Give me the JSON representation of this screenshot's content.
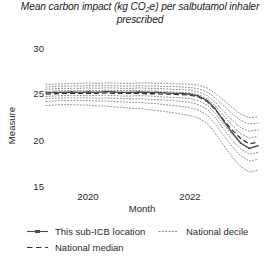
{
  "chart_data": {
    "type": "line",
    "title": "Mean carbon impact (kg CO2e) per salbutamol inhaler prescribed",
    "title_line1": "Mean carbon impact (kg CO",
    "title_line1b": "e) per salbutamol inhaler",
    "title_sub": "2",
    "title_line2": "prescribed",
    "xlabel": "Month",
    "ylabel": "Measure",
    "xlim": [
      2019.0,
      2023.25
    ],
    "ylim": [
      14.0,
      30.6
    ],
    "yticks": [
      30,
      25,
      20,
      15
    ],
    "ytick_labels": [
      "30",
      "25",
      "20",
      "15"
    ],
    "xticks": [
      2020,
      2022
    ],
    "xtick_labels": [
      "2020",
      "2022"
    ],
    "grid": false,
    "legend_position": "bottom-left",
    "x": [
      2019.0,
      2019.17,
      2019.33,
      2019.5,
      2019.67,
      2019.83,
      2020.0,
      2020.17,
      2020.33,
      2020.5,
      2020.67,
      2020.83,
      2021.0,
      2021.17,
      2021.33,
      2021.5,
      2021.67,
      2021.83,
      2022.0,
      2022.17,
      2022.33,
      2022.5,
      2022.67,
      2022.83,
      2023.0,
      2023.17
    ],
    "series": [
      {
        "name": "This sub-ICB location",
        "style": "solid-marker",
        "color": "#4d4d4d",
        "values": [
          24.75,
          24.8,
          24.8,
          24.85,
          24.8,
          24.85,
          24.8,
          24.9,
          24.85,
          24.8,
          24.8,
          24.85,
          24.8,
          24.8,
          24.75,
          24.7,
          24.7,
          24.6,
          24.4,
          23.9,
          23.0,
          21.6,
          20.3,
          19.2,
          18.6,
          18.9
        ]
      },
      {
        "name": "National median",
        "style": "dashed",
        "color": "#333333",
        "values": [
          24.6,
          24.65,
          24.7,
          24.7,
          24.7,
          24.7,
          24.7,
          24.75,
          24.7,
          24.7,
          24.7,
          24.7,
          24.65,
          24.65,
          24.6,
          24.6,
          24.55,
          24.5,
          24.3,
          23.8,
          22.9,
          21.7,
          20.6,
          19.7,
          19.1,
          19.3
        ]
      },
      {
        "name": "National decile",
        "style": "dotted",
        "color": "#8c8c8c",
        "decile": 90,
        "values": [
          25.7,
          25.7,
          25.75,
          25.8,
          25.8,
          25.85,
          25.8,
          25.85,
          25.85,
          25.8,
          25.8,
          25.85,
          25.85,
          25.8,
          25.8,
          25.75,
          25.75,
          25.7,
          25.6,
          25.3,
          24.7,
          23.9,
          23.1,
          22.4,
          22.0,
          22.1
        ]
      },
      {
        "name": "National decile",
        "style": "dotted",
        "color": "#8c8c8c",
        "decile": 80,
        "values": [
          25.4,
          25.45,
          25.5,
          25.5,
          25.5,
          25.55,
          25.5,
          25.55,
          25.55,
          25.5,
          25.5,
          25.55,
          25.5,
          25.5,
          25.45,
          25.45,
          25.4,
          25.35,
          25.2,
          24.85,
          24.2,
          23.3,
          22.4,
          21.7,
          21.3,
          21.4
        ]
      },
      {
        "name": "National decile",
        "style": "dotted",
        "color": "#8c8c8c",
        "decile": 70,
        "values": [
          25.15,
          25.2,
          25.25,
          25.25,
          25.25,
          25.3,
          25.25,
          25.3,
          25.3,
          25.25,
          25.25,
          25.3,
          25.25,
          25.25,
          25.2,
          25.15,
          25.1,
          25.05,
          24.85,
          24.45,
          23.7,
          22.7,
          21.7,
          20.9,
          20.5,
          20.65
        ]
      },
      {
        "name": "National decile",
        "style": "dotted",
        "color": "#8c8c8c",
        "decile": 60,
        "values": [
          24.9,
          24.95,
          25.0,
          25.0,
          25.0,
          25.0,
          25.0,
          25.05,
          25.0,
          25.0,
          25.0,
          25.0,
          24.95,
          24.95,
          24.9,
          24.85,
          24.8,
          24.75,
          24.55,
          24.1,
          23.3,
          22.2,
          21.1,
          20.25,
          19.75,
          19.95
        ]
      },
      {
        "name": "National decile",
        "style": "dotted",
        "color": "#8c8c8c",
        "decile": 40,
        "values": [
          24.35,
          24.4,
          24.45,
          24.45,
          24.45,
          24.45,
          24.45,
          24.5,
          24.45,
          24.4,
          24.4,
          24.45,
          24.4,
          24.35,
          24.3,
          24.25,
          24.2,
          24.1,
          23.9,
          23.4,
          22.5,
          21.25,
          20.1,
          19.2,
          18.6,
          18.8
        ]
      },
      {
        "name": "National decile",
        "style": "dotted",
        "color": "#8c8c8c",
        "decile": 30,
        "values": [
          24.1,
          24.15,
          24.2,
          24.2,
          24.2,
          24.2,
          24.15,
          24.2,
          24.15,
          24.1,
          24.1,
          24.1,
          24.05,
          24.0,
          23.95,
          23.9,
          23.8,
          23.7,
          23.45,
          22.95,
          22.0,
          20.7,
          19.5,
          18.55,
          17.95,
          18.15
        ]
      },
      {
        "name": "National decile",
        "style": "dotted",
        "color": "#8c8c8c",
        "decile": 20,
        "values": [
          23.8,
          23.85,
          23.9,
          23.9,
          23.9,
          23.9,
          23.85,
          23.85,
          23.8,
          23.75,
          23.7,
          23.7,
          23.6,
          23.55,
          23.45,
          23.35,
          23.25,
          23.1,
          22.85,
          22.3,
          21.3,
          20.0,
          18.75,
          17.8,
          17.2,
          17.4
        ]
      },
      {
        "name": "National decile",
        "style": "dotted",
        "color": "#8c8c8c",
        "decile": 10,
        "values": [
          23.35,
          23.4,
          23.45,
          23.45,
          23.4,
          23.4,
          23.3,
          23.3,
          23.2,
          23.15,
          23.05,
          23.0,
          22.9,
          22.8,
          22.7,
          22.55,
          22.4,
          22.25,
          21.95,
          21.4,
          20.3,
          18.9,
          17.6,
          16.6,
          16.0,
          16.2
        ]
      }
    ]
  },
  "legend": {
    "items": [
      {
        "label": "This sub-ICB location",
        "style": "solid-marker"
      },
      {
        "label": "National decile",
        "style": "dotted"
      },
      {
        "label": "National median",
        "style": "dashed"
      }
    ]
  }
}
